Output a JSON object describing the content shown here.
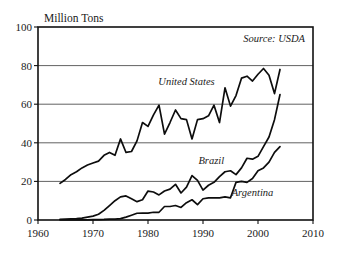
{
  "chart_data": {
    "type": "line",
    "title": "",
    "unit_label": "Million Tons",
    "source_note": "Source: USDA",
    "xlabel": "",
    "ylabel": "Million Tons",
    "xlim": [
      1960,
      2010
    ],
    "ylim": [
      0,
      100
    ],
    "xticks": [
      1960,
      1970,
      1980,
      1990,
      2000,
      2010
    ],
    "yticks": [
      0,
      20,
      40,
      60,
      80,
      100
    ],
    "grid": "horizontal",
    "legend_position": "inline-annotations",
    "line_color": "#0d0d0d",
    "grid_color": "#3a3a3a",
    "frame_color": "#111111",
    "series": [
      {
        "name": "United States",
        "label_x": 1987.0,
        "label_y": 70.0,
        "x": [
          1964,
          1965,
          1966,
          1967,
          1968,
          1969,
          1970,
          1971,
          1972,
          1973,
          1974,
          1975,
          1976,
          1977,
          1978,
          1979,
          1980,
          1981,
          1982,
          1983,
          1984,
          1985,
          1986,
          1987,
          1988,
          1989,
          1990,
          1991,
          1992,
          1993,
          1994,
          1995,
          1996,
          1997,
          1998,
          1999,
          2000,
          2001,
          2002,
          2003,
          2004
        ],
        "values": [
          19.0,
          21.0,
          23.5,
          25.0,
          27.0,
          28.5,
          29.5,
          30.5,
          33.5,
          35.0,
          33.5,
          42.0,
          35.0,
          35.5,
          41.0,
          50.5,
          48.5,
          54.5,
          59.5,
          44.5,
          50.5,
          57.0,
          52.5,
          52.0,
          42.0,
          52.0,
          52.5,
          54.0,
          59.5,
          50.5,
          68.5,
          59.0,
          64.5,
          73.5,
          74.5,
          72.0,
          75.5,
          78.5,
          75.0,
          65.5,
          78.0
        ]
      },
      {
        "name": "Brazil",
        "label_x": 1991.5,
        "label_y": 29.0,
        "x": [
          1964,
          1965,
          1966,
          1967,
          1968,
          1969,
          1970,
          1971,
          1972,
          1973,
          1974,
          1975,
          1976,
          1977,
          1978,
          1979,
          1980,
          1981,
          1982,
          1983,
          1984,
          1985,
          1986,
          1987,
          1988,
          1989,
          1990,
          1991,
          1992,
          1993,
          1994,
          1995,
          1996,
          1997,
          1998,
          1999,
          2000,
          2001,
          2002,
          2003,
          2004
        ],
        "values": [
          0.4,
          0.5,
          0.6,
          0.7,
          1.0,
          1.5,
          2.0,
          3.0,
          5.0,
          7.5,
          10.0,
          12.0,
          12.5,
          11.0,
          9.5,
          10.5,
          15.0,
          14.5,
          13.0,
          15.0,
          16.0,
          18.5,
          14.0,
          17.0,
          23.0,
          20.5,
          15.5,
          18.0,
          19.5,
          22.5,
          25.0,
          25.5,
          23.5,
          27.0,
          32.0,
          31.5,
          33.0,
          38.0,
          43.0,
          52.0,
          65.0
        ]
      },
      {
        "name": "Argentina",
        "label_x": 1999.0,
        "label_y": 12.5,
        "x": [
          1964,
          1965,
          1966,
          1967,
          1968,
          1969,
          1970,
          1971,
          1972,
          1973,
          1974,
          1975,
          1976,
          1977,
          1978,
          1979,
          1980,
          1981,
          1982,
          1983,
          1984,
          1985,
          1986,
          1987,
          1988,
          1989,
          1990,
          1991,
          1992,
          1993,
          1994,
          1995,
          1996,
          1997,
          1998,
          1999,
          2000,
          2001,
          2002,
          2003,
          2004
        ],
        "values": [
          0.1,
          0.1,
          0.1,
          0.1,
          0.1,
          0.1,
          0.2,
          0.2,
          0.3,
          0.5,
          0.5,
          0.7,
          1.5,
          2.5,
          3.5,
          3.6,
          3.6,
          4.0,
          4.0,
          7.0,
          7.0,
          7.5,
          6.5,
          9.0,
          10.5,
          8.0,
          11.0,
          11.5,
          11.5,
          11.5,
          12.0,
          11.5,
          19.5,
          20.0,
          19.5,
          21.5,
          25.5,
          27.0,
          30.0,
          35.0,
          38.0
        ]
      }
    ]
  }
}
